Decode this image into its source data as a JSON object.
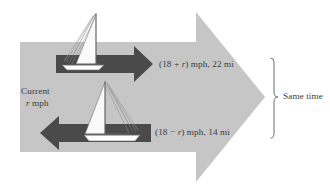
{
  "figure": {
    "name": "boat-current-rate-diagram",
    "background_color": "#ffffff",
    "big_arrow_color": "#c6c6c6",
    "boat_arrow_color": "#4a4a4a",
    "text_color": "#3b3b3b",
    "sail_color": "#f7f7f7",
    "hull_color": "#ffffff"
  },
  "labels": {
    "upstream": {
      "full": "(18 + r) mph, 22 mi",
      "prefix": "(18 + ",
      "variable": "r",
      "suffix": ") mph, 22 mi",
      "speed": "18 + r",
      "speed_units": "mph",
      "distance": "22",
      "distance_units": "mi"
    },
    "downstream": {
      "full": "(18 − r) mph, 14 mi",
      "prefix": "(18 − ",
      "variable": "r",
      "suffix": ") mph, 14 mi",
      "speed": "18 − r",
      "speed_units": "mph",
      "distance": "14",
      "distance_units": "mi"
    },
    "current": {
      "line1": "Current",
      "variable": "r",
      "line2_units": " mph"
    },
    "same_time": "Same time"
  },
  "elements": {
    "big_arrow_name": "current-direction-arrow",
    "upper_boat_name": "sailboat-with-current",
    "lower_boat_name": "sailboat-against-current",
    "upper_arrow_name": "downstream-direction-arrow",
    "lower_arrow_name": "upstream-direction-arrow",
    "bracket_name": "same-time-bracket"
  }
}
